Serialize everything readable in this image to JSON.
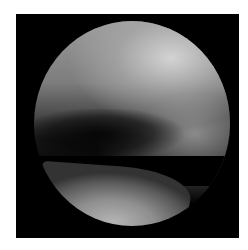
{
  "image": {
    "description": "Grayscale arthroscopic view inside a circular scope field on black square frame",
    "colors": {
      "background": "#ffffff",
      "frame": "#000000",
      "tissue_highlight": "#d7d7d7",
      "tissue_mid": "#8a8a8a",
      "shadow": "#000000"
    }
  }
}
